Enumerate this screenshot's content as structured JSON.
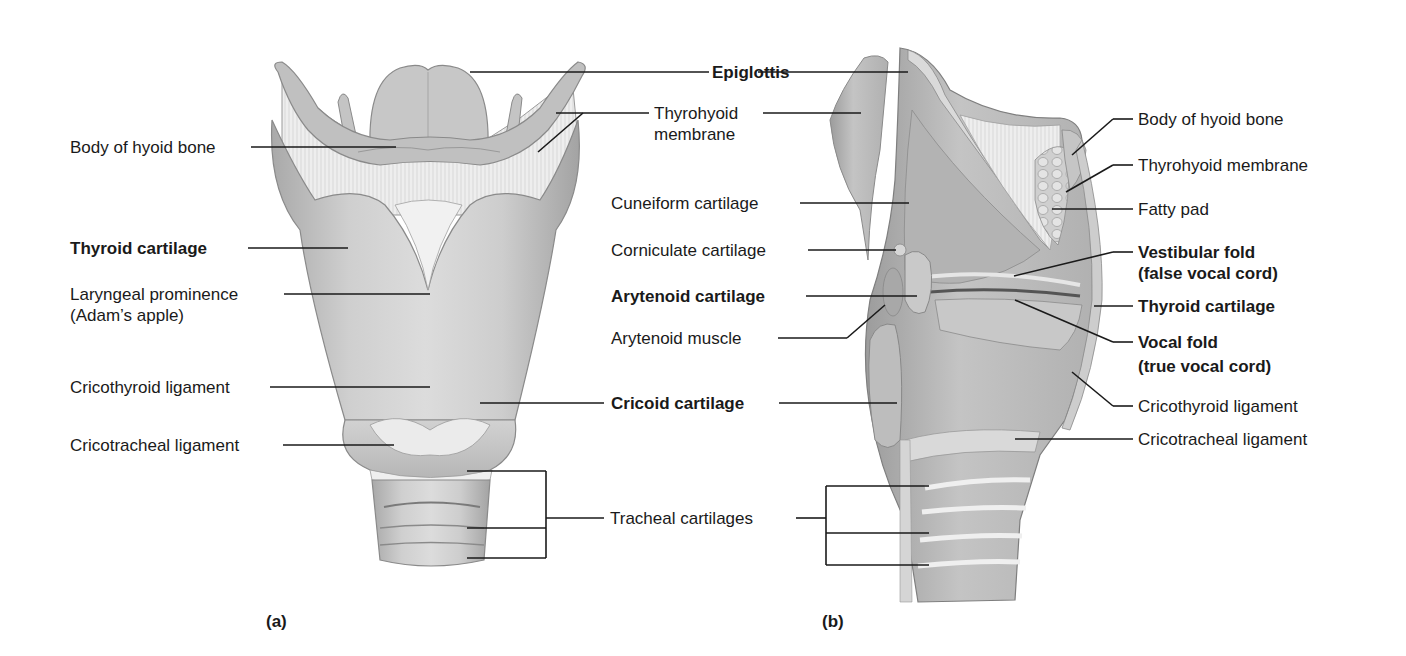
{
  "figure": {
    "panel_a": {
      "letter": "(a)",
      "view": "anterior",
      "labels": [
        {
          "id": "body-of-hyoid-bone-a",
          "text": "Body of hyoid bone",
          "bold": false
        },
        {
          "id": "thyroid-cartilage-a",
          "text": "Thyroid cartilage",
          "bold": true
        },
        {
          "id": "laryngeal-prominence",
          "text": "Laryngeal prominence",
          "text2": "(Adam’s apple)",
          "bold": false
        },
        {
          "id": "cricothyroid-ligament-a",
          "text": "Cricothyroid ligament",
          "bold": false
        },
        {
          "id": "cricotracheal-ligament-a",
          "text": "Cricotracheal ligament",
          "bold": false
        }
      ]
    },
    "shared": {
      "labels": [
        {
          "id": "epiglottis",
          "text": "Epiglottis",
          "bold": true
        },
        {
          "id": "thyrohyoid-membrane-a",
          "text": "Thyrohyoid",
          "text2": "membrane",
          "bold": false
        },
        {
          "id": "cricoid-cartilage",
          "text": "Cricoid cartilage",
          "bold": true
        },
        {
          "id": "tracheal-cartilages",
          "text": "Tracheal cartilages",
          "bold": false
        }
      ]
    },
    "panel_b": {
      "letter": "(b)",
      "view": "sagittal",
      "left_labels": [
        {
          "id": "cuneiform-cartilage",
          "text": "Cuneiform cartilage",
          "bold": false
        },
        {
          "id": "corniculate-cartilage",
          "text": "Corniculate cartilage",
          "bold": false
        },
        {
          "id": "arytenoid-cartilage",
          "text": "Arytenoid cartilage",
          "bold": true
        },
        {
          "id": "arytenoid-muscle",
          "text": "Arytenoid muscle",
          "bold": false
        }
      ],
      "right_labels": [
        {
          "id": "body-of-hyoid-bone-b",
          "text": "Body of hyoid bone",
          "bold": false
        },
        {
          "id": "thyrohyoid-membrane-b",
          "text": "Thyrohyoid membrane",
          "bold": false
        },
        {
          "id": "fatty-pad",
          "text": "Fatty pad",
          "bold": false
        },
        {
          "id": "vestibular-fold",
          "text": "Vestibular fold",
          "text2": "(false vocal cord)",
          "bold": true
        },
        {
          "id": "thyroid-cartilage-b",
          "text": "Thyroid cartilage",
          "bold": true
        },
        {
          "id": "vocal-fold",
          "text": "Vocal fold",
          "text2": "(true vocal cord)",
          "bold": true
        },
        {
          "id": "cricothyroid-ligament-b",
          "text": "Cricothyroid ligament",
          "bold": false
        },
        {
          "id": "cricotracheal-ligament-b",
          "text": "Cricotracheal ligament",
          "bold": false
        }
      ]
    },
    "colors": {
      "background": "#ffffff",
      "text": "#1a1a1a",
      "leader_line": "#1a1a1a",
      "cartilage_light": "#d6d6d6",
      "cartilage_mid": "#b9b9b9",
      "cartilage_dark": "#8e8e8e",
      "membrane": "#ececec"
    }
  }
}
